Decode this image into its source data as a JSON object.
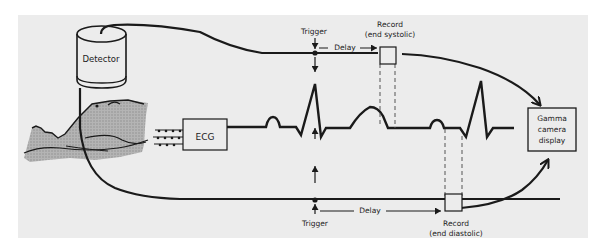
{
  "colors": {
    "background": "#ffffff",
    "panel": "#ececec",
    "ink": "#1a1a1a",
    "patient_shade": "#9a9a9a"
  },
  "labels": {
    "detector": "Detector",
    "ecg": "ECG",
    "trigger_top": "Trigger",
    "trigger_bottom": "Trigger",
    "delay_top": "Delay",
    "delay_bottom": "Delay",
    "record_systolic_line1": "Record",
    "record_systolic_line2": "(end systolic)",
    "record_diastolic_line1": "Record",
    "record_diastolic_line2": "(end diastolic)",
    "gamma_line1": "Gamma",
    "gamma_line2": "camera",
    "gamma_line3": "display"
  }
}
